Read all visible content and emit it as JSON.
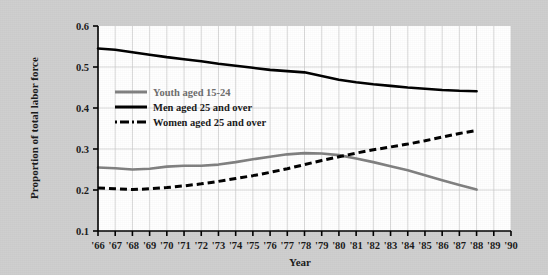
{
  "figure": {
    "background_color": "#cfcfcf",
    "plot_background_color": "#ffffff",
    "grid_color": "#c8c8c8",
    "axis_color": "#000000"
  },
  "axes": {
    "y_axis_title": "Proportion of total labor force",
    "x_axis_title": "Year",
    "y_tick_labels": [
      "0.6",
      "0.5",
      "0.4",
      "0.3",
      "0.2",
      "0.1"
    ],
    "x_tick_labels": [
      "'66",
      "'67",
      "'68",
      "'69",
      "'70",
      "'71",
      "'72",
      "'73",
      "'74",
      "'75",
      "'76",
      "'77",
      "'78",
      "'79",
      "'80",
      "'81",
      "'82",
      "'83",
      "'84",
      "'85",
      "'86",
      "'87",
      "'88",
      "'89",
      "'90"
    ]
  },
  "legend": {
    "position": "upper-left-inside",
    "entries": [
      {
        "label": "Youth aged 15-24",
        "color": "#808080",
        "style": "solid"
      },
      {
        "label": "Men aged 25 and over",
        "color": "#000000",
        "style": "solid"
      },
      {
        "label": "Women aged 25 and over",
        "color": "#000000",
        "style": "dashed"
      }
    ]
  },
  "chart_data": {
    "type": "line",
    "title": "",
    "xlabel": "Year",
    "ylabel": "Proportion of total labor force",
    "xlim": [
      1966,
      1990
    ],
    "ylim": [
      0.1,
      0.6
    ],
    "grid": true,
    "legend_position": "upper-left-inside",
    "x": [
      1966,
      1967,
      1968,
      1969,
      1970,
      1971,
      1972,
      1973,
      1974,
      1975,
      1976,
      1977,
      1978,
      1979,
      1980,
      1981,
      1982,
      1983,
      1984,
      1985,
      1986,
      1987,
      1988
    ],
    "series": [
      {
        "name": "Youth aged 15-24",
        "color": "#808080",
        "style": "solid",
        "values": [
          0.255,
          0.253,
          0.25,
          0.252,
          0.257,
          0.259,
          0.259,
          0.262,
          0.268,
          0.275,
          0.281,
          0.287,
          0.29,
          0.289,
          0.285,
          0.277,
          0.268,
          0.258,
          0.248,
          0.236,
          0.224,
          0.212,
          0.201
        ]
      },
      {
        "name": "Men aged 25 and over",
        "color": "#000000",
        "style": "solid",
        "values": [
          0.545,
          0.542,
          0.536,
          0.53,
          0.524,
          0.519,
          0.514,
          0.508,
          0.503,
          0.498,
          0.493,
          0.49,
          0.487,
          0.478,
          0.469,
          0.463,
          0.458,
          0.454,
          0.45,
          0.447,
          0.444,
          0.442,
          0.441
        ]
      },
      {
        "name": "Women aged 25 and over",
        "color": "#000000",
        "style": "dashed",
        "values": [
          0.205,
          0.203,
          0.201,
          0.203,
          0.206,
          0.21,
          0.215,
          0.221,
          0.228,
          0.235,
          0.243,
          0.252,
          0.262,
          0.272,
          0.281,
          0.29,
          0.298,
          0.305,
          0.312,
          0.32,
          0.329,
          0.338,
          0.345
        ]
      }
    ]
  }
}
